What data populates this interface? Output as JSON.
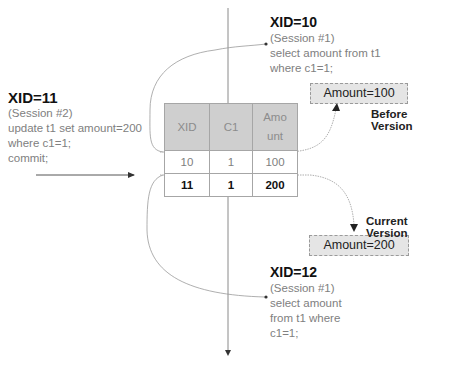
{
  "session2": {
    "title": "XID=11",
    "lines": [
      "(Session #2)",
      "update t1 set amount=200",
      "where c1=1;",
      "commit;"
    ]
  },
  "session1_first": {
    "title": "XID=10",
    "lines": [
      "(Session #1)",
      "select amount from t1",
      "where c1=1;"
    ]
  },
  "session1_second": {
    "title": "XID=12",
    "lines": [
      "(Session #1)",
      "select amount",
      "from t1 where",
      "c1=1;"
    ]
  },
  "table": {
    "headers": [
      "XID",
      "C1",
      "Amo\nunt"
    ],
    "header_line1": "Amo",
    "header_line2": "unt",
    "rows": [
      {
        "xid": "10",
        "c1": "1",
        "amount": "100",
        "bold": false
      },
      {
        "xid": "11",
        "c1": "1",
        "amount": "200",
        "bold": true
      }
    ]
  },
  "before_version": {
    "box": "Amount=100",
    "label": "Before Version"
  },
  "current_version": {
    "box": "Amount=200",
    "label": "Current Version"
  },
  "colors": {
    "header_fill": "#cfcfcf",
    "box_fill": "#e5e5e5",
    "line": "#8a8a8a"
  }
}
